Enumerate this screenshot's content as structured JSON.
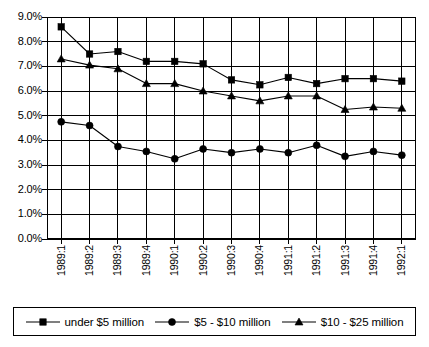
{
  "chart_data": {
    "type": "line",
    "title": "",
    "subtitle": "",
    "xlabel": "",
    "ylabel": "",
    "ylim": [
      0.0,
      9.0
    ],
    "ytick_labels": [
      "0.0%",
      "1.0%",
      "2.0%",
      "3.0%",
      "4.0%",
      "5.0%",
      "6.0%",
      "7.0%",
      "8.0%",
      "9.0%"
    ],
    "ytick_values": [
      0.0,
      1.0,
      2.0,
      3.0,
      4.0,
      5.0,
      6.0,
      7.0,
      8.0,
      9.0
    ],
    "grid": true,
    "grid_axis": "both",
    "legend_position": "bottom",
    "value_suffix": "%",
    "categories": [
      "1989:1",
      "1989:2",
      "1989:3",
      "1989:4",
      "1990:1",
      "1990:2",
      "1990:3",
      "1990:4",
      "1991:1",
      "1991:2",
      "1991:3",
      "1991:4",
      "1992:1"
    ],
    "series": [
      {
        "name": "under $5 million",
        "marker": "square",
        "color": "#000000",
        "values": [
          8.6,
          7.5,
          7.6,
          7.2,
          7.2,
          7.1,
          6.45,
          6.25,
          6.55,
          6.3,
          6.5,
          6.5,
          6.4
        ]
      },
      {
        "name": "$5 - $10 million",
        "marker": "circle",
        "color": "#000000",
        "values": [
          4.75,
          4.6,
          3.75,
          3.55,
          3.25,
          3.65,
          3.5,
          3.65,
          3.5,
          3.8,
          3.35,
          3.55,
          3.4
        ]
      },
      {
        "name": "$10 - $25 million",
        "marker": "triangle",
        "color": "#000000",
        "values": [
          7.3,
          7.05,
          6.9,
          6.3,
          6.3,
          6.0,
          5.8,
          5.6,
          5.8,
          5.8,
          5.25,
          5.35,
          5.3
        ]
      }
    ]
  },
  "legend": {
    "items": [
      {
        "label": "under $5 million",
        "marker": "square"
      },
      {
        "label": "$5 - $10 million",
        "marker": "circle"
      },
      {
        "label": "$10 - $25 million",
        "marker": "triangle"
      }
    ]
  },
  "colors": {
    "axis": "#000000",
    "grid": "#000000",
    "background": "#ffffff",
    "series": "#000000"
  }
}
